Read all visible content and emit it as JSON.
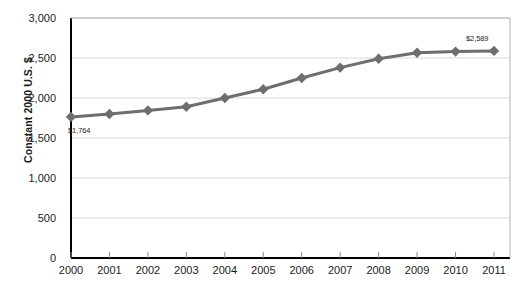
{
  "chart_data": {
    "type": "line",
    "title": "",
    "subtitle": "",
    "xlabel": "",
    "ylabel": "Constant 2000 U.S. $",
    "x": [
      2000,
      2001,
      2002,
      2003,
      2004,
      2005,
      2006,
      2007,
      2008,
      2009,
      2010,
      2011
    ],
    "xtick_labels": [
      "2000",
      "2001",
      "2002",
      "2003",
      "2004",
      "2005",
      "2006",
      "2007",
      "2008",
      "2009",
      "2010",
      "2011"
    ],
    "values": [
      1764,
      1800,
      1845,
      1890,
      2000,
      2110,
      2250,
      2380,
      2490,
      2565,
      2580,
      2589
    ],
    "ylim": [
      0,
      3000
    ],
    "xlim": [
      2000,
      2011
    ],
    "ytick_values": [
      0,
      500,
      1000,
      1500,
      2000,
      2500,
      3000
    ],
    "ytick_labels": [
      "0",
      "500",
      "1,000",
      "1,500",
      "2,000",
      "2,500",
      "3,000"
    ],
    "grid": true,
    "grid_axis": "y",
    "legend": false,
    "legend_position": "none",
    "series": [
      {
        "name": "Constant 2000 U.S. $",
        "color": "#6e6e6e",
        "marker": "diamond",
        "values": [
          1764,
          1800,
          1845,
          1890,
          2000,
          2110,
          2250,
          2380,
          2490,
          2565,
          2580,
          2589
        ]
      }
    ],
    "annotations": [
      {
        "name": "first-point-label",
        "text": "$1,764",
        "x": 2000,
        "y": 1764
      },
      {
        "name": "last-point-label",
        "text": "$2,589",
        "x": 2011,
        "y": 2589
      }
    ],
    "colors": {
      "line": "#6e6e6e",
      "marker": "#6e6e6e",
      "grid": "#d9d9d9",
      "axis": "#000000",
      "text": "#1b1b1b",
      "background": "#ffffff"
    }
  }
}
